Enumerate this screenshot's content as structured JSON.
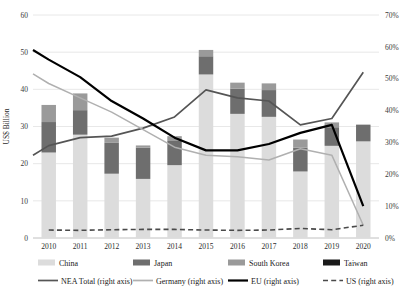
{
  "chart_data": {
    "type": "bar",
    "title": "",
    "subtitle": "",
    "xlabel": "",
    "ylabel": "US$ Billion",
    "y2label": "",
    "categories": [
      "2010",
      "2011",
      "2012",
      "2013",
      "2014",
      "2015",
      "2016",
      "2017",
      "2018",
      "2019",
      "2020"
    ],
    "ylim": [
      0,
      60
    ],
    "yticks": [
      0,
      10,
      20,
      30,
      40,
      50,
      60
    ],
    "ytick_labels": [
      "0",
      "10",
      "20",
      "30",
      "40",
      "50",
      "60"
    ],
    "y2lim": [
      0,
      70
    ],
    "y2ticks": [
      0,
      10,
      20,
      30,
      40,
      50,
      60,
      70
    ],
    "y2tick_labels": [
      "0%",
      "10%",
      "20%",
      "30%",
      "40%",
      "50%",
      "60%",
      "70%"
    ],
    "grid": true,
    "legend_position": "bottom",
    "stacked": true,
    "bar_series": [
      {
        "name": "China",
        "axis": "left",
        "color": "#dcdcdc",
        "values": [
          23.0,
          27.8,
          17.3,
          15.9,
          19.6,
          44.0,
          33.4,
          32.6,
          17.9,
          24.8,
          26.0
        ]
      },
      {
        "name": "Japan",
        "axis": "left",
        "color": "#6e6e6e",
        "values": [
          8.2,
          6.6,
          8.3,
          8.4,
          6.5,
          4.9,
          6.8,
          7.2,
          6.4,
          5.0,
          4.5
        ]
      },
      {
        "name": "South Korea",
        "axis": "left",
        "color": "#9a9a9a",
        "values": [
          4.6,
          4.5,
          1.4,
          0.6,
          1.3,
          1.7,
          1.6,
          1.8,
          2.2,
          1.3,
          0.0
        ]
      },
      {
        "name": "Taiwan",
        "axis": "left",
        "color": "#1a1a1a",
        "values": [
          0.0,
          0.0,
          0.0,
          0.0,
          0.0,
          0.0,
          0.0,
          0.0,
          0.0,
          0.0,
          0.0
        ]
      }
    ],
    "line_series": [
      {
        "name": "NEA Total (right axis)",
        "axis": "right",
        "color": "#555555",
        "style": "solid",
        "width": 1.7,
        "values": [
          26.0,
          29.0,
          31.5,
          32.0,
          34.5,
          38.0,
          46.5,
          44.0,
          43.0,
          35.5,
          37.5,
          52.0
        ]
      },
      {
        "name": "Germany (right axis)",
        "axis": "right",
        "color": "#b0b0b0",
        "style": "solid",
        "width": 1.5,
        "values": [
          51.5,
          48.5,
          44.0,
          39.5,
          34.0,
          28.5,
          26.0,
          25.5,
          24.5,
          28.0,
          26.0,
          4.0
        ]
      },
      {
        "name": "EU (right axis)",
        "axis": "right",
        "color": "#000000",
        "style": "solid",
        "width": 2.2,
        "values": [
          59.0,
          56.0,
          50.5,
          43.0,
          37.5,
          31.5,
          27.5,
          27.5,
          29.5,
          33.0,
          35.5,
          10.0
        ]
      },
      {
        "name": "US (right axis)",
        "axis": "right",
        "color": "#4a4a4a",
        "style": "dashed",
        "width": 1.6,
        "values": [
          2.5,
          2.4,
          2.6,
          2.7,
          2.7,
          2.5,
          2.4,
          2.5,
          3.0,
          2.6,
          4.0
        ]
      }
    ],
    "line_values_note": "NEA Total, Germany and EU series are plotted with an extra leading point at the left plot edge"
  },
  "legend": {
    "row1": [
      {
        "label": "China",
        "swatch": "#dcdcdc",
        "type": "swatch"
      },
      {
        "label": "Japan",
        "swatch": "#6e6e6e",
        "type": "swatch"
      },
      {
        "label": "South Korea",
        "swatch": "#9a9a9a",
        "type": "swatch"
      },
      {
        "label": "Taiwan",
        "swatch": "#1a1a1a",
        "type": "swatch"
      }
    ],
    "row2": [
      {
        "label": "NEA Total (right axis)",
        "swatch": "#555555",
        "type": "line",
        "style": "solid"
      },
      {
        "label": "Germany (right axis)",
        "swatch": "#b0b0b0",
        "type": "line",
        "style": "solid"
      },
      {
        "label": "EU (right axis)",
        "swatch": "#000000",
        "type": "line",
        "style": "solid"
      },
      {
        "label": "US (right axis)",
        "swatch": "#4a4a4a",
        "type": "line",
        "style": "dashed"
      }
    ]
  }
}
